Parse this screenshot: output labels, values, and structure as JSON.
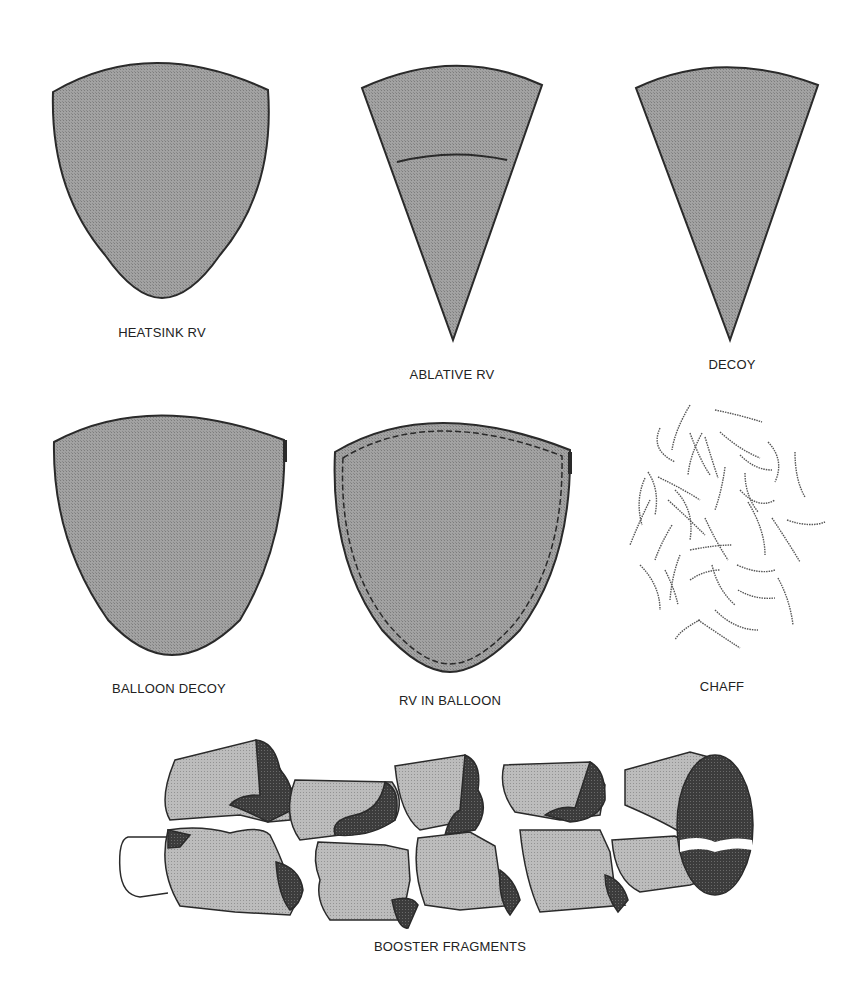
{
  "figure": {
    "colors": {
      "background": "#ffffff",
      "body_fill": "#9a9a9a",
      "fragment_light": "#b4b4b4",
      "fragment_dark": "#3a3a3a",
      "outline": "#2a2a2a",
      "label": "#222222"
    },
    "objects": [
      {
        "id": "heatsink-rv",
        "label": "HEATSINK RV",
        "shape": "blunt-paraboloid"
      },
      {
        "id": "ablative-rv",
        "label": "ABLATIVE RV",
        "shape": "cone-with-band"
      },
      {
        "id": "decoy",
        "label": "DECOY",
        "shape": "cone"
      },
      {
        "id": "balloon-decoy",
        "label": "BALLOON DECOY",
        "shape": "blunt-paraboloid"
      },
      {
        "id": "rv-in-balloon",
        "label": "RV IN BALLOON",
        "shape": "blunt-paraboloid-dashed"
      },
      {
        "id": "chaff",
        "label": "CHAFF",
        "shape": "scattered-fibers"
      },
      {
        "id": "booster-fragments",
        "label": "BOOSTER FRAGMENTS",
        "shape": "broken-cylinder"
      }
    ]
  }
}
